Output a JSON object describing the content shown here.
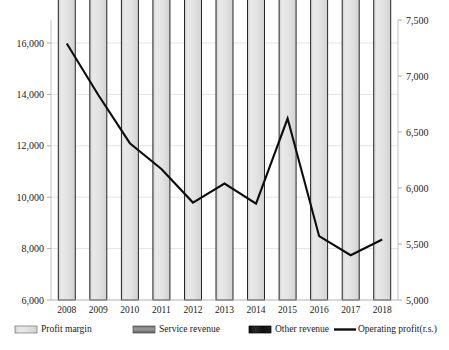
{
  "chart_data": {
    "type": "bar",
    "subtype": "stacked-bar-with-line-overlay",
    "title": "",
    "xlabel": "",
    "ylabel": "",
    "grid": true,
    "legend_position": "bottom",
    "categories": [
      "2008",
      "2009",
      "2010",
      "2011",
      "2012",
      "2013",
      "2014",
      "2015",
      "2016",
      "2017",
      "2018"
    ],
    "left_axis": {
      "label": "",
      "ylim": [
        6000,
        16000
      ],
      "ticks": [
        6000,
        8000,
        10000,
        12000,
        14000,
        16000
      ],
      "tick_labels": [
        "6,000",
        "8,000",
        "10,000",
        "12,000",
        "14,000",
        "16,000"
      ]
    },
    "right_axis": {
      "label": "",
      "ylim": [
        5000,
        7500
      ],
      "ticks": [
        5000,
        5500,
        6000,
        6500,
        7000,
        7500
      ],
      "tick_labels": [
        "5,000",
        "5,500",
        "6,000",
        "6,500",
        "7,000",
        "7,500"
      ]
    },
    "series": [
      {
        "name": "Profit margin",
        "axis": "left",
        "type": "bar-segment",
        "color": "#e2e2e2",
        "values": [
          12500,
          13500,
          14200,
          14300,
          14100,
          14200,
          14000,
          14100,
          13450,
          13350,
          13200
        ]
      },
      {
        "name": "Service revenue",
        "axis": "left",
        "type": "bar-segment",
        "color": "#8a8a8a",
        "values": [
          2200,
          1850,
          1900,
          1920,
          1850,
          2100,
          2200,
          2300,
          2050,
          2050,
          2150
        ]
      },
      {
        "name": "Other revenue",
        "axis": "left",
        "type": "bar-segment",
        "color": "#141414",
        "values": [
          430,
          470,
          420,
          400,
          400,
          400,
          400,
          430,
          460,
          130,
          80
        ]
      },
      {
        "name": "Operating profit(r.s.)",
        "axis": "right",
        "type": "line",
        "color": "#0d0d0d",
        "values": [
          7290,
          6830,
          6400,
          6170,
          5870,
          6040,
          5860,
          6620,
          5570,
          5400,
          5540
        ]
      }
    ],
    "stack_totals": [
      15130,
      15820,
      16520,
      16620,
      16350,
      16700,
      16600,
      16830,
      15960,
      15530,
      15430
    ]
  },
  "legend": {
    "items": [
      {
        "label": "Profit margin",
        "swatch": "profit-margin-swatch"
      },
      {
        "label": "Service revenue",
        "swatch": "service-revenue-swatch"
      },
      {
        "label": "Other revenue",
        "swatch": "other-revenue-swatch"
      },
      {
        "label": "Operating profit(r.s.)",
        "swatch": "operating-profit-line-swatch"
      }
    ]
  }
}
